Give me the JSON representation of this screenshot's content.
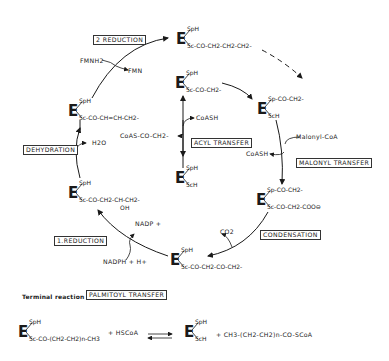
{
  "diagram": {
    "steps": {
      "reduction2": "2 REDUCTION",
      "dehydration": "DEHYDRATION",
      "reduction1": "1.REDUCTION",
      "acyl_transfer": "ACYL TRANSFER",
      "malonyl_transfer": "MALONYL TRANSFER",
      "condensation": "CONDENSATION"
    },
    "cofactors": {
      "fmnh2": "FMNH2",
      "fmn": "FMN",
      "h2o": "H2O",
      "nadp": "NADP +",
      "nadph": "NADPH + H+",
      "co2": "CO2",
      "coash_acyl": "CoASH",
      "coas_acyl": "CoAS-CO-CH2-",
      "malonyl_coa": "Malonyl-CoA",
      "coash_malonyl": "CoASH"
    },
    "enzymes": [
      {
        "id": "butyryl",
        "top": "SpH",
        "bottom": "Sc-CO-CH2-CH2-CH2-"
      },
      {
        "id": "acetyl",
        "top": "SpH",
        "bottom": "Sc-CO-CH2-"
      },
      {
        "id": "free",
        "top": "SpH",
        "bottom": "ScH"
      },
      {
        "id": "acetyl-p",
        "top": "Sp-CO-CH2-",
        "bottom": "ScH"
      },
      {
        "id": "malonyl",
        "top": "Sp-CO-CH2-",
        "bottom": "Sc-CO-CH2-COO⊖"
      },
      {
        "id": "acetoacetyl",
        "top": "SpH",
        "bottom": "Sc-CO-CH2-CO-CH2-"
      },
      {
        "id": "hydroxy",
        "top": "SpH",
        "bottom": "Sc-CO-CH2-CH-CH2-",
        "sub": "OH"
      },
      {
        "id": "enoyl",
        "top": "SpH",
        "bottom": "Sc-CO-CH=CH-CH2-"
      }
    ],
    "terminal": {
      "label": "Terminal reaction :",
      "step": "PALMITOYL TRANSFER",
      "left_top": "SpH",
      "left_bottom": "Sc-CO-(CH2-CH2)n-CH3",
      "plus1": "+ HSCoA",
      "equilibrium": "⇌",
      "right_top": "SpH",
      "right_bottom": "ScH",
      "plus2": "+ CH3-(CH2-CH2)n-CO-SCoA"
    },
    "enzyme_symbol": "E"
  }
}
